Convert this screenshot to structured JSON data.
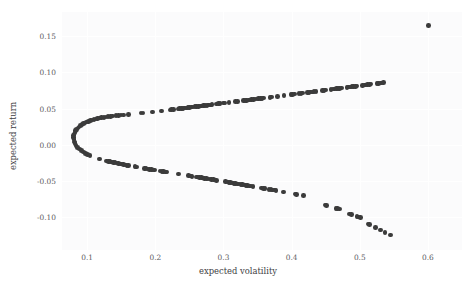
{
  "chart_data": {
    "type": "scatter",
    "title": "",
    "xlabel": "expected volatility",
    "ylabel": "expected return",
    "xlim": [
      0.063,
      0.65
    ],
    "ylim": [
      -0.145,
      0.183
    ],
    "xticks": [
      0.1,
      0.2,
      0.3,
      0.4,
      0.5,
      0.6
    ],
    "xticklabels": [
      "0.1",
      "0.2",
      "0.3",
      "0.4",
      "0.5",
      "0.6"
    ],
    "yticks": [
      -0.1,
      -0.05,
      0.0,
      0.05,
      0.1,
      0.15
    ],
    "yticklabels": [
      "-0.10",
      "-0.05",
      "0.00",
      "0.05",
      "0.10",
      "0.15"
    ],
    "grid": true,
    "legend": null,
    "marker_color": "#3b3b3b",
    "marker_size": 4.6,
    "background": "#fbfbfc",
    "series": [
      {
        "name": "portfolios",
        "points": [
          [
            0.0805,
            0.0075
          ],
          [
            0.08,
            0.01
          ],
          [
            0.0802,
            0.0125
          ],
          [
            0.0808,
            0.015
          ],
          [
            0.0818,
            0.0172
          ],
          [
            0.083,
            0.0193
          ],
          [
            0.0845,
            0.0212
          ],
          [
            0.0862,
            0.023
          ],
          [
            0.088,
            0.0247
          ],
          [
            0.09,
            0.0262
          ],
          [
            0.0922,
            0.0277
          ],
          [
            0.0945,
            0.029
          ],
          [
            0.0968,
            0.0302
          ],
          [
            0.0993,
            0.0313
          ],
          [
            0.1018,
            0.0323
          ],
          [
            0.1044,
            0.0332
          ],
          [
            0.107,
            0.034
          ],
          [
            0.1098,
            0.0348
          ],
          [
            0.1126,
            0.0355
          ],
          [
            0.1155,
            0.0361
          ],
          [
            0.1184,
            0.0367
          ],
          [
            0.1214,
            0.0372
          ],
          [
            0.1244,
            0.0377
          ],
          [
            0.1275,
            0.0382
          ],
          [
            0.1306,
            0.0386
          ],
          [
            0.1338,
            0.039
          ],
          [
            0.137,
            0.0394
          ],
          [
            0.1425,
            0.04
          ],
          [
            0.146,
            0.0404
          ],
          [
            0.1495,
            0.0408
          ],
          [
            0.153,
            0.0412
          ],
          [
            0.161,
            0.0421
          ],
          [
            0.179,
            0.0437
          ],
          [
            0.182,
            0.044
          ],
          [
            0.196,
            0.0453
          ],
          [
            0.209,
            0.0466
          ],
          [
            0.2215,
            0.048
          ],
          [
            0.224,
            0.0483
          ],
          [
            0.2265,
            0.0486
          ],
          [
            0.233,
            0.0494
          ],
          [
            0.2355,
            0.0497
          ],
          [
            0.238,
            0.05
          ],
          [
            0.2405,
            0.0503
          ],
          [
            0.243,
            0.0506
          ],
          [
            0.2455,
            0.0509
          ],
          [
            0.248,
            0.0512
          ],
          [
            0.2505,
            0.0515
          ],
          [
            0.253,
            0.0518
          ],
          [
            0.2555,
            0.0521
          ],
          [
            0.258,
            0.0524
          ],
          [
            0.2605,
            0.0527
          ],
          [
            0.263,
            0.053
          ],
          [
            0.2655,
            0.0533
          ],
          [
            0.268,
            0.0536
          ],
          [
            0.2705,
            0.0539
          ],
          [
            0.273,
            0.0542
          ],
          [
            0.2755,
            0.0545
          ],
          [
            0.278,
            0.0548
          ],
          [
            0.2805,
            0.0551
          ],
          [
            0.283,
            0.0554
          ],
          [
            0.29,
            0.0562
          ],
          [
            0.2925,
            0.0565
          ],
          [
            0.295,
            0.0568
          ],
          [
            0.3,
            0.0574
          ],
          [
            0.3025,
            0.0577
          ],
          [
            0.308,
            0.0583
          ],
          [
            0.318,
            0.0595
          ],
          [
            0.3205,
            0.0598
          ],
          [
            0.329,
            0.0608
          ],
          [
            0.3315,
            0.0611
          ],
          [
            0.334,
            0.0614
          ],
          [
            0.3365,
            0.0617
          ],
          [
            0.339,
            0.062
          ],
          [
            0.3415,
            0.0623
          ],
          [
            0.344,
            0.0626
          ],
          [
            0.3465,
            0.0629
          ],
          [
            0.349,
            0.0632
          ],
          [
            0.3515,
            0.0635
          ],
          [
            0.354,
            0.0638
          ],
          [
            0.3565,
            0.0641
          ],
          [
            0.359,
            0.0644
          ],
          [
            0.368,
            0.0655
          ],
          [
            0.3705,
            0.0658
          ],
          [
            0.379,
            0.0668
          ],
          [
            0.389,
            0.068
          ],
          [
            0.399,
            0.0692
          ],
          [
            0.4015,
            0.0695
          ],
          [
            0.404,
            0.0698
          ],
          [
            0.411,
            0.0707
          ],
          [
            0.4135,
            0.071
          ],
          [
            0.416,
            0.0713
          ],
          [
            0.423,
            0.0721
          ],
          [
            0.4255,
            0.0724
          ],
          [
            0.428,
            0.0727
          ],
          [
            0.4305,
            0.073
          ],
          [
            0.433,
            0.0733
          ],
          [
            0.4355,
            0.0736
          ],
          [
            0.445,
            0.0748
          ],
          [
            0.4475,
            0.0751
          ],
          [
            0.45,
            0.0754
          ],
          [
            0.458,
            0.0764
          ],
          [
            0.4605,
            0.0767
          ],
          [
            0.463,
            0.077
          ],
          [
            0.4655,
            0.0773
          ],
          [
            0.468,
            0.0776
          ],
          [
            0.4705,
            0.0779
          ],
          [
            0.473,
            0.0782
          ],
          [
            0.481,
            0.0792
          ],
          [
            0.4835,
            0.0795
          ],
          [
            0.486,
            0.0798
          ],
          [
            0.4885,
            0.0801
          ],
          [
            0.491,
            0.0804
          ],
          [
            0.4935,
            0.0807
          ],
          [
            0.496,
            0.081
          ],
          [
            0.504,
            0.082
          ],
          [
            0.5065,
            0.0823
          ],
          [
            0.509,
            0.0826
          ],
          [
            0.5115,
            0.0829
          ],
          [
            0.514,
            0.0832
          ],
          [
            0.5165,
            0.0835
          ],
          [
            0.525,
            0.0845
          ],
          [
            0.5275,
            0.0848
          ],
          [
            0.53,
            0.0851
          ],
          [
            0.5325,
            0.0854
          ],
          [
            0.535,
            0.0857
          ],
          [
            0.601,
            0.164
          ],
          [
            0.081,
            0.004
          ],
          [
            0.082,
            0.0015
          ],
          [
            0.0838,
            -0.001
          ],
          [
            0.086,
            -0.0035
          ],
          [
            0.0885,
            -0.0058
          ],
          [
            0.0912,
            -0.008
          ],
          [
            0.0942,
            -0.01
          ],
          [
            0.0973,
            -0.0118
          ],
          [
            0.1005,
            -0.0135
          ],
          [
            0.1038,
            -0.015
          ],
          [
            0.118,
            -0.0198
          ],
          [
            0.1285,
            -0.0222
          ],
          [
            0.131,
            -0.0227
          ],
          [
            0.1335,
            -0.0232
          ],
          [
            0.136,
            -0.0237
          ],
          [
            0.1385,
            -0.0242
          ],
          [
            0.141,
            -0.0247
          ],
          [
            0.1435,
            -0.0252
          ],
          [
            0.146,
            -0.0257
          ],
          [
            0.1485,
            -0.0262
          ],
          [
            0.151,
            -0.0267
          ],
          [
            0.1535,
            -0.0272
          ],
          [
            0.156,
            -0.0277
          ],
          [
            0.1585,
            -0.0282
          ],
          [
            0.161,
            -0.0287
          ],
          [
            0.17,
            -0.0302
          ],
          [
            0.1725,
            -0.0306
          ],
          [
            0.184,
            -0.0325
          ],
          [
            0.1865,
            -0.0329
          ],
          [
            0.189,
            -0.0333
          ],
          [
            0.1915,
            -0.0337
          ],
          [
            0.194,
            -0.0341
          ],
          [
            0.1965,
            -0.0345
          ],
          [
            0.199,
            -0.0349
          ],
          [
            0.207,
            -0.0361
          ],
          [
            0.2095,
            -0.0365
          ],
          [
            0.212,
            -0.0369
          ],
          [
            0.2145,
            -0.0373
          ],
          [
            0.217,
            -0.0377
          ],
          [
            0.234,
            -0.0402
          ],
          [
            0.249,
            -0.0425
          ],
          [
            0.2515,
            -0.0429
          ],
          [
            0.254,
            -0.0433
          ],
          [
            0.26,
            -0.0442
          ],
          [
            0.2625,
            -0.0446
          ],
          [
            0.265,
            -0.045
          ],
          [
            0.2675,
            -0.0454
          ],
          [
            0.27,
            -0.0458
          ],
          [
            0.2725,
            -0.0462
          ],
          [
            0.275,
            -0.0466
          ],
          [
            0.2775,
            -0.047
          ],
          [
            0.28,
            -0.0474
          ],
          [
            0.2825,
            -0.0478
          ],
          [
            0.285,
            -0.0482
          ],
          [
            0.2875,
            -0.0486
          ],
          [
            0.29,
            -0.049
          ],
          [
            0.303,
            -0.051
          ],
          [
            0.3055,
            -0.0514
          ],
          [
            0.308,
            -0.0518
          ],
          [
            0.3105,
            -0.0522
          ],
          [
            0.313,
            -0.0526
          ],
          [
            0.3155,
            -0.053
          ],
          [
            0.318,
            -0.0534
          ],
          [
            0.3205,
            -0.0538
          ],
          [
            0.323,
            -0.0542
          ],
          [
            0.3255,
            -0.0546
          ],
          [
            0.328,
            -0.055
          ],
          [
            0.3305,
            -0.0554
          ],
          [
            0.333,
            -0.0558
          ],
          [
            0.3355,
            -0.0562
          ],
          [
            0.338,
            -0.0566
          ],
          [
            0.3405,
            -0.057
          ],
          [
            0.343,
            -0.0574
          ],
          [
            0.356,
            -0.0595
          ],
          [
            0.3585,
            -0.0599
          ],
          [
            0.361,
            -0.0603
          ],
          [
            0.367,
            -0.0613
          ],
          [
            0.3695,
            -0.0617
          ],
          [
            0.372,
            -0.0621
          ],
          [
            0.3745,
            -0.0625
          ],
          [
            0.377,
            -0.0629
          ],
          [
            0.388,
            -0.0648
          ],
          [
            0.405,
            -0.0678
          ],
          [
            0.4075,
            -0.0682
          ],
          [
            0.417,
            -0.07
          ],
          [
            0.449,
            -0.0828
          ],
          [
            0.4515,
            -0.0834
          ],
          [
            0.465,
            -0.0875
          ],
          [
            0.4675,
            -0.0881
          ],
          [
            0.47,
            -0.0887
          ],
          [
            0.485,
            -0.0952
          ],
          [
            0.4875,
            -0.0958
          ],
          [
            0.496,
            -0.0988
          ],
          [
            0.4985,
            -0.0994
          ],
          [
            0.501,
            -0.1
          ],
          [
            0.512,
            -0.109
          ],
          [
            0.5145,
            -0.1096
          ],
          [
            0.523,
            -0.114
          ],
          [
            0.53,
            -0.1175
          ],
          [
            0.537,
            -0.1205
          ],
          [
            0.545,
            -0.1245
          ]
        ]
      }
    ]
  }
}
